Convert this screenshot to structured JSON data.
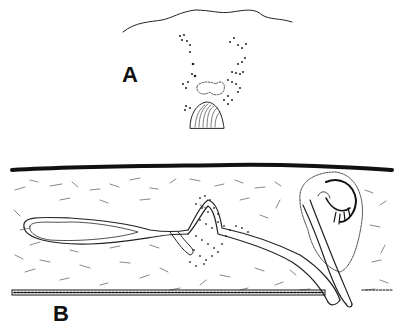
{
  "figure": {
    "panels": [
      {
        "id": "A",
        "label": "A"
      },
      {
        "id": "B",
        "label": "B"
      }
    ]
  },
  "colors": {
    "ink": "#111111",
    "background": "#ffffff"
  }
}
